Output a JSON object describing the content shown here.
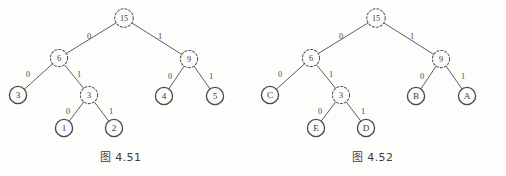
{
  "page": {
    "background_color": "#fdfdfc",
    "ink_color": "#4a4a4a",
    "width": 506,
    "height": 176
  },
  "figures": [
    {
      "id": "figure-4-51",
      "caption_prefix": "图",
      "caption_number": "4.51",
      "caption_full": "图 4.51",
      "caption_x": 100,
      "caption_y": 148,
      "nodes": [
        {
          "id": "n15",
          "label": "15",
          "x": 124,
          "y": 18,
          "r": 9.2,
          "style": "dashed"
        },
        {
          "id": "n6",
          "label": "6",
          "x": 59,
          "y": 58,
          "r": 8.6,
          "style": "dashed"
        },
        {
          "id": "n9",
          "label": "9",
          "x": 189,
          "y": 59,
          "r": 8.6,
          "style": "dashed"
        },
        {
          "id": "n3a",
          "label": "3",
          "x": 18,
          "y": 95,
          "r": 8.6,
          "style": "solid"
        },
        {
          "id": "n3b",
          "label": "3",
          "x": 89,
          "y": 95,
          "r": 8.6,
          "style": "dashed"
        },
        {
          "id": "n4",
          "label": "4",
          "x": 164,
          "y": 96,
          "r": 8.6,
          "style": "solid"
        },
        {
          "id": "n5",
          "label": "5",
          "x": 215,
          "y": 96,
          "r": 8.6,
          "style": "solid"
        },
        {
          "id": "n1",
          "label": "1",
          "x": 64,
          "y": 128,
          "r": 8.6,
          "style": "solid"
        },
        {
          "id": "n2",
          "label": "2",
          "x": 114,
          "y": 128,
          "r": 8.6,
          "style": "solid"
        }
      ],
      "edges": [
        {
          "from": "n15",
          "to": "n6",
          "label": "0",
          "lx": 89,
          "ly": 36
        },
        {
          "from": "n15",
          "to": "n9",
          "label": "1",
          "lx": 160,
          "ly": 36
        },
        {
          "from": "n6",
          "to": "n3a",
          "label": "0",
          "lx": 28,
          "ly": 74
        },
        {
          "from": "n6",
          "to": "n3b",
          "label": "1",
          "lx": 79,
          "ly": 74
        },
        {
          "from": "n9",
          "to": "n4",
          "label": "0",
          "lx": 170,
          "ly": 76
        },
        {
          "from": "n9",
          "to": "n5",
          "label": "1",
          "lx": 211,
          "ly": 76
        },
        {
          "from": "n3b",
          "to": "n1",
          "label": "0",
          "lx": 68,
          "ly": 111
        },
        {
          "from": "n3b",
          "to": "n2",
          "label": "1",
          "lx": 111,
          "ly": 111
        }
      ]
    },
    {
      "id": "figure-4-52",
      "caption_prefix": "图",
      "caption_number": "4.52",
      "caption_full": "图 4.52",
      "caption_x": 352,
      "caption_y": 148,
      "nodes": [
        {
          "id": "m15",
          "label": "15",
          "x": 376,
          "y": 18,
          "r": 9.2,
          "style": "dashed"
        },
        {
          "id": "m6",
          "label": "6",
          "x": 311,
          "y": 58,
          "r": 8.6,
          "style": "dashed"
        },
        {
          "id": "m9",
          "label": "9",
          "x": 441,
          "y": 59,
          "r": 8.6,
          "style": "dashed"
        },
        {
          "id": "mC",
          "label": "C",
          "x": 270,
          "y": 95,
          "r": 8.6,
          "style": "solid"
        },
        {
          "id": "m3",
          "label": "3",
          "x": 341,
          "y": 95,
          "r": 8.6,
          "style": "dashed"
        },
        {
          "id": "mB",
          "label": "B",
          "x": 416,
          "y": 96,
          "r": 8.6,
          "style": "solid"
        },
        {
          "id": "mA",
          "label": "A",
          "x": 467,
          "y": 96,
          "r": 8.6,
          "style": "solid"
        },
        {
          "id": "mE",
          "label": "E",
          "x": 316,
          "y": 128,
          "r": 8.6,
          "style": "solid"
        },
        {
          "id": "mD",
          "label": "D",
          "x": 366,
          "y": 128,
          "r": 8.6,
          "style": "solid"
        }
      ],
      "edges": [
        {
          "from": "m15",
          "to": "m6",
          "label": "0",
          "lx": 341,
          "ly": 36
        },
        {
          "from": "m15",
          "to": "m9",
          "label": "1",
          "lx": 412,
          "ly": 36
        },
        {
          "from": "m6",
          "to": "mC",
          "label": "0",
          "lx": 280,
          "ly": 74
        },
        {
          "from": "m6",
          "to": "m3",
          "label": "1",
          "lx": 331,
          "ly": 74
        },
        {
          "from": "m9",
          "to": "mB",
          "label": "0",
          "lx": 422,
          "ly": 76
        },
        {
          "from": "m9",
          "to": "mA",
          "label": "1",
          "lx": 463,
          "ly": 76
        },
        {
          "from": "m3",
          "to": "mE",
          "label": "0",
          "lx": 320,
          "ly": 111
        },
        {
          "from": "m3",
          "to": "mD",
          "label": "1",
          "lx": 363,
          "ly": 111
        }
      ]
    }
  ]
}
